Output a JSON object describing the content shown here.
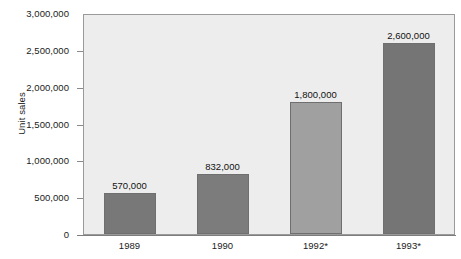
{
  "chart_data": {
    "type": "bar",
    "title": "",
    "subtitle": "",
    "xlabel": "",
    "ylabel": "Unit sales",
    "categories": [
      "1989",
      "1990",
      "1992*",
      "1993*"
    ],
    "values": [
      570000,
      832000,
      1800000,
      2600000
    ],
    "value_labels": [
      "570,000",
      "832,000",
      "1,800,000",
      "2,600,000"
    ],
    "bar_colors": [
      "#787878",
      "#7c7c7c",
      "#a0a0a0",
      "#757575"
    ],
    "ylim": [
      0,
      3000000
    ],
    "ytick_values": [
      0,
      500000,
      1000000,
      1500000,
      2000000,
      2500000,
      3000000
    ],
    "ytick_labels": [
      "0",
      "500,000",
      "1,000,000",
      "1,500,000",
      "2,000,000",
      "2,500,000",
      "3,000,000"
    ],
    "grid": false,
    "legend": false,
    "legend_position": "none",
    "plot_background": "#ededed",
    "page_background": "#ffffff",
    "axis_color": "#8a8a8a",
    "annotations": [
      "* values for 1992 and 1993 are marked with an asterisk"
    ]
  },
  "axis": {
    "y_title": "Unit sales"
  }
}
